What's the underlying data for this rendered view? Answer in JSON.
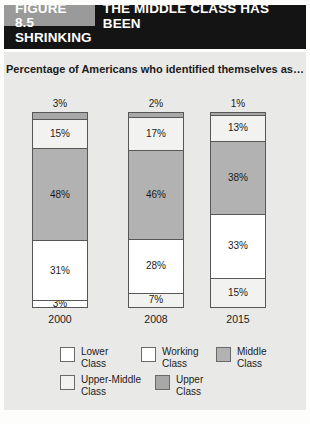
{
  "header": {
    "figure_tag": "FIGURE 8.5",
    "title_line1": "THE MIDDLE CLASS HAS BEEN",
    "title_line2": "SHRINKING"
  },
  "colors": {
    "banner_bg": "#141414",
    "figure_tag_bg": "#9a9a9a",
    "panel_bg": "#e9e9e7",
    "lower_class": "#ffffff",
    "working_class": "#ffffff",
    "middle_class": "#b2b2b2",
    "upper_middle_class": "#f2f2f0",
    "upper_class": "#a8a8a8",
    "outline": "#575757"
  },
  "chart_data": {
    "type": "bar",
    "title": "THE MIDDLE CLASS HAS BEEN SHRINKING",
    "subtitle": "Percentage of Americans who identified themselves as…",
    "xlabel": "",
    "ylabel": "",
    "ylim": [
      0,
      100
    ],
    "grid": false,
    "stacked": true,
    "legend_position": "bottom",
    "categories": [
      "2000",
      "2008",
      "2015"
    ],
    "series": [
      {
        "name": "Lower Class",
        "values": [
          3,
          7,
          15
        ]
      },
      {
        "name": "Working Class",
        "values": [
          31,
          28,
          33
        ]
      },
      {
        "name": "Middle Class",
        "values": [
          48,
          46,
          38
        ]
      },
      {
        "name": "Upper-Middle Class",
        "values": [
          15,
          17,
          13
        ]
      },
      {
        "name": "Upper Class",
        "values": [
          3,
          2,
          1
        ]
      }
    ],
    "columns": [
      {
        "year": "2000",
        "top_label": "3%",
        "segments": [
          {
            "name": "Upper Class",
            "value": 3,
            "label": "3%",
            "label_visible": false,
            "fill": "#a8a8a8"
          },
          {
            "name": "Upper-Middle Class",
            "value": 15,
            "label": "15%",
            "label_visible": true,
            "fill": "#f2f2f0"
          },
          {
            "name": "Middle Class",
            "value": 48,
            "label": "48%",
            "label_visible": true,
            "fill": "#b2b2b2"
          },
          {
            "name": "Working Class",
            "value": 31,
            "label": "31%",
            "label_visible": true,
            "fill": "#ffffff"
          },
          {
            "name": "Lower Class",
            "value": 3,
            "label": "3%",
            "label_visible": true,
            "fill": "#ffffff"
          }
        ]
      },
      {
        "year": "2008",
        "top_label": "2%",
        "segments": [
          {
            "name": "Upper Class",
            "value": 2,
            "label": "2%",
            "label_visible": false,
            "fill": "#a8a8a8"
          },
          {
            "name": "Upper-Middle Class",
            "value": 17,
            "label": "17%",
            "label_visible": true,
            "fill": "#f2f2f0"
          },
          {
            "name": "Middle Class",
            "value": 46,
            "label": "46%",
            "label_visible": true,
            "fill": "#b2b2b2"
          },
          {
            "name": "Working Class",
            "value": 28,
            "label": "28%",
            "label_visible": true,
            "fill": "#ffffff"
          },
          {
            "name": "Lower Class",
            "value": 7,
            "label": "7%",
            "label_visible": true,
            "fill": "#f2f2f0"
          }
        ]
      },
      {
        "year": "2015",
        "top_label": "1%",
        "segments": [
          {
            "name": "Upper Class",
            "value": 1,
            "label": "1%",
            "label_visible": false,
            "fill": "#a8a8a8"
          },
          {
            "name": "Upper-Middle Class",
            "value": 13,
            "label": "13%",
            "label_visible": true,
            "fill": "#f2f2f0"
          },
          {
            "name": "Middle Class",
            "value": 38,
            "label": "38%",
            "label_visible": true,
            "fill": "#b2b2b2"
          },
          {
            "name": "Working Class",
            "value": 33,
            "label": "33%",
            "label_visible": true,
            "fill": "#ffffff"
          },
          {
            "name": "Lower Class",
            "value": 15,
            "label": "15%",
            "label_visible": true,
            "fill": "#f2f2f0"
          }
        ]
      }
    ],
    "legend": [
      {
        "label": "Lower\nClass",
        "fill": "#ffffff"
      },
      {
        "label": "Working\nClass",
        "fill": "#ffffff"
      },
      {
        "label": "Middle\nClass",
        "fill": "#b2b2b2"
      },
      {
        "label": "Upper-Middle\nClass",
        "fill": "#f2f2f0"
      },
      {
        "label": "Upper\nClass",
        "fill": "#a8a8a8"
      }
    ]
  }
}
